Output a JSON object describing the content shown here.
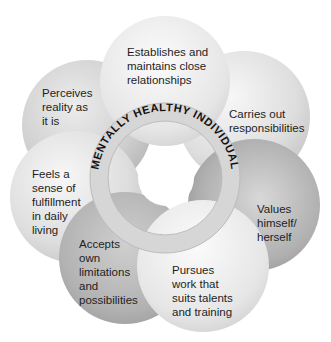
{
  "diagram": {
    "center_label": "MENTALLY HEALTHY INDIVIDUAL",
    "nodes": [
      {
        "id": "perceives",
        "lines": [
          "Perceives",
          "reality as",
          "it is"
        ],
        "fill": "#d6d6d6"
      },
      {
        "id": "feels",
        "lines": [
          "Feels a",
          "sense of",
          "fulfillment",
          "in daily",
          "living"
        ],
        "fill": "#e4e4e4"
      },
      {
        "id": "accepts",
        "lines": [
          "Accepts",
          "own",
          "limitations",
          "and",
          "possibilities"
        ],
        "fill": "#b4b4b4"
      },
      {
        "id": "pursues",
        "lines": [
          "Pursues",
          "work that",
          "suits talents",
          "and training"
        ],
        "fill": "#ececec"
      },
      {
        "id": "values",
        "lines": [
          "Values",
          "himself/",
          "herself"
        ],
        "fill": "#a9a9a9"
      },
      {
        "id": "carries",
        "lines": [
          "Carries out",
          "responsibilities"
        ],
        "fill": "#dcdcdc"
      },
      {
        "id": "establishes",
        "lines": [
          "Establishes and",
          "maintains close",
          "relationships"
        ],
        "fill": "#e8e8e8"
      }
    ],
    "colors": {
      "ring": "#d9d9d9",
      "ring_stroke": "#bdbdbd",
      "text": "#1e1e1e",
      "background": "#ffffff"
    }
  }
}
